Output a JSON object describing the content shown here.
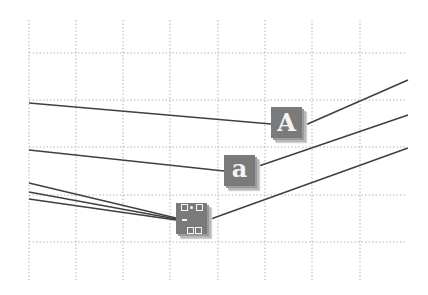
{
  "diagram": {
    "background": "#ffffff",
    "grid": {
      "color": "#b4b4b4",
      "style": "dotted",
      "vertical_x": [
        29,
        76,
        123,
        170,
        218,
        265,
        312,
        360
      ],
      "horizontal_y": [
        53,
        100,
        147,
        195,
        242
      ],
      "x_range": [
        29,
        407
      ],
      "y_range": [
        20,
        280
      ]
    },
    "line_color": "#404040",
    "nodes": [
      {
        "id": "uppercase",
        "label": "A",
        "icon": "uppercase-letter-icon",
        "x": 271,
        "y": 107
      },
      {
        "id": "lowercase",
        "label": "a",
        "icon": "lowercase-letter-icon",
        "x": 224,
        "y": 155
      },
      {
        "id": "keypad",
        "label": "",
        "icon": "keypad-symbols-icon",
        "x": 176,
        "y": 203
      }
    ],
    "edges": [
      {
        "from": [
          29,
          103
        ],
        "to": [
          271,
          124
        ]
      },
      {
        "from": [
          303,
          126
        ],
        "to": [
          408,
          80
        ]
      },
      {
        "from": [
          29,
          150
        ],
        "to": [
          224,
          171
        ]
      },
      {
        "from": [
          256,
          167
        ],
        "to": [
          408,
          115
        ]
      },
      {
        "from": [
          29,
          183
        ],
        "to": [
          176,
          218
        ]
      },
      {
        "from": [
          29,
          192
        ],
        "to": [
          176,
          219
        ]
      },
      {
        "from": [
          29,
          199
        ],
        "to": [
          176,
          220
        ]
      },
      {
        "from": [
          208,
          220
        ],
        "to": [
          408,
          148
        ]
      }
    ]
  }
}
